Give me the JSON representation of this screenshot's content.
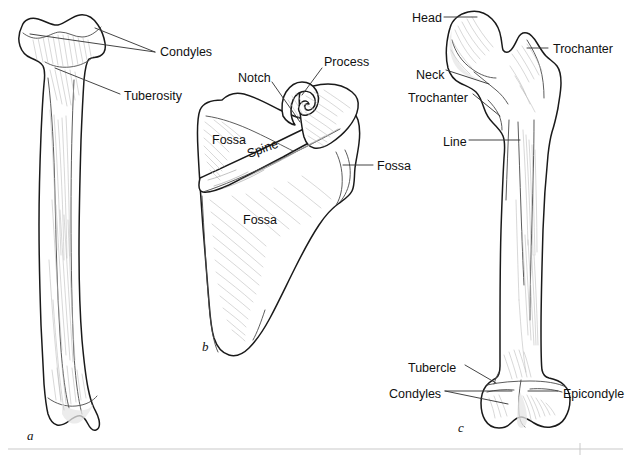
{
  "figure": {
    "background_color": "#ffffff",
    "outline_color": "#1a1a1a",
    "label_color": "#111111",
    "leader_color": "#3a3a3a",
    "hatch_color": "#b8b8b8",
    "footer_rule_color": "#c9c9c9"
  },
  "panels": [
    {
      "letter": "a",
      "bone": "tibia",
      "x": 78,
      "y": 440
    },
    {
      "letter": "b",
      "bone": "scapula",
      "x": 202,
      "y": 351
    },
    {
      "letter": "c",
      "bone": "femur",
      "x": 458,
      "y": 432
    }
  ],
  "labels": {
    "tibia": [
      {
        "text": "Condyles",
        "x": 160,
        "y": 52,
        "anchor": "start"
      },
      {
        "text": "Tuberosity",
        "x": 124,
        "y": 96,
        "anchor": "start"
      }
    ],
    "scapula": [
      {
        "text": "Notch",
        "x": 238,
        "y": 78,
        "anchor": "start"
      },
      {
        "text": "Process",
        "x": 324,
        "y": 62,
        "anchor": "start"
      },
      {
        "text": "Fossa",
        "x": 212,
        "y": 140,
        "anchor": "start"
      },
      {
        "text": "Fossa",
        "x": 377,
        "y": 168,
        "anchor": "start"
      },
      {
        "text": "Fossa",
        "x": 243,
        "y": 220,
        "anchor": "start"
      },
      {
        "text": "Spine",
        "x": 249,
        "y": 155,
        "anchor": "start",
        "rotate": -20
      }
    ],
    "femur": [
      {
        "text": "Head",
        "x": 412,
        "y": 20,
        "anchor": "start"
      },
      {
        "text": "Trochanter",
        "x": 553,
        "y": 51,
        "anchor": "start"
      },
      {
        "text": "Neck",
        "x": 416,
        "y": 75,
        "anchor": "start"
      },
      {
        "text": "Trochanter",
        "x": 412,
        "y": 98,
        "anchor": "start"
      },
      {
        "text": "Line",
        "x": 443,
        "y": 143,
        "anchor": "start"
      },
      {
        "text": "Tubercle",
        "x": 410,
        "y": 369,
        "anchor": "start"
      },
      {
        "text": "Condyles",
        "x": 392,
        "y": 395,
        "anchor": "start"
      },
      {
        "text": "Epicondyle",
        "x": 563,
        "y": 395,
        "anchor": "start"
      }
    ]
  }
}
